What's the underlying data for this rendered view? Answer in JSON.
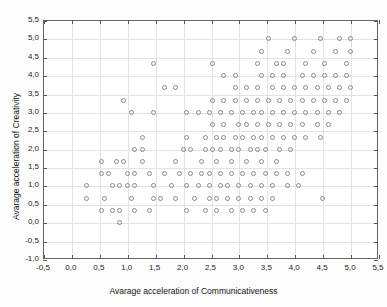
{
  "chart_data": {
    "type": "scatter",
    "title": "",
    "xlabel": "Avarage acceleration of Communicativeness",
    "ylabel": "Avarage acceleration of Creativity",
    "xlim": [
      -0.5,
      5.5
    ],
    "ylim": [
      -1.0,
      5.5
    ],
    "xticks": [
      -0.5,
      0.0,
      0.5,
      1.0,
      1.5,
      2.0,
      2.5,
      3.0,
      3.5,
      4.0,
      4.5,
      5.0,
      5.5
    ],
    "yticks": [
      -1.0,
      -0.5,
      0.0,
      0.5,
      1.0,
      1.5,
      2.0,
      2.5,
      3.0,
      3.5,
      4.0,
      4.5,
      5.0,
      5.5
    ],
    "xtick_labels": [
      "-0,5",
      "0,0",
      "0,5",
      "1,0",
      "1,5",
      "2,0",
      "2,5",
      "3,0",
      "3,5",
      "4,0",
      "4,5",
      "5,0",
      "5,5"
    ],
    "ytick_labels": [
      "-1,0",
      "-0,5",
      "0,0",
      "0,5",
      "1,0",
      "1,5",
      "2,0",
      "2,5",
      "3,0",
      "3,5",
      "4,0",
      "4,5",
      "5,0",
      "5,5"
    ],
    "grid": true,
    "legend": false,
    "marker": "open-circle",
    "marker_color": "#8a8a94",
    "points": [
      [
        0.87,
        0.0
      ],
      [
        0.53,
        0.33
      ],
      [
        0.73,
        0.33
      ],
      [
        0.87,
        0.33
      ],
      [
        1.13,
        0.33
      ],
      [
        1.4,
        0.33
      ],
      [
        2.07,
        0.33
      ],
      [
        2.4,
        0.33
      ],
      [
        2.6,
        0.33
      ],
      [
        2.87,
        0.33
      ],
      [
        3.07,
        0.33
      ],
      [
        3.27,
        0.33
      ],
      [
        3.47,
        0.33
      ],
      [
        0.27,
        0.67
      ],
      [
        0.6,
        0.67
      ],
      [
        1.07,
        0.67
      ],
      [
        1.47,
        0.67
      ],
      [
        1.6,
        0.67
      ],
      [
        1.87,
        0.67
      ],
      [
        2.2,
        0.67
      ],
      [
        2.47,
        0.67
      ],
      [
        2.6,
        0.67
      ],
      [
        2.8,
        0.67
      ],
      [
        3.0,
        0.67
      ],
      [
        3.2,
        0.67
      ],
      [
        3.4,
        0.67
      ],
      [
        3.6,
        0.67
      ],
      [
        4.5,
        0.65
      ],
      [
        0.27,
        1.0
      ],
      [
        0.73,
        1.0
      ],
      [
        0.87,
        1.0
      ],
      [
        1.0,
        1.0
      ],
      [
        1.13,
        1.0
      ],
      [
        1.47,
        1.0
      ],
      [
        1.8,
        1.0
      ],
      [
        2.07,
        1.0
      ],
      [
        2.27,
        1.0
      ],
      [
        2.47,
        1.0
      ],
      [
        2.67,
        1.0
      ],
      [
        2.8,
        1.0
      ],
      [
        3.0,
        1.0
      ],
      [
        3.2,
        1.0
      ],
      [
        3.4,
        1.0
      ],
      [
        3.6,
        1.0
      ],
      [
        3.87,
        1.0
      ],
      [
        4.07,
        1.0
      ],
      [
        0.53,
        1.33
      ],
      [
        0.67,
        1.33
      ],
      [
        1.0,
        1.33
      ],
      [
        1.13,
        1.33
      ],
      [
        1.4,
        1.33
      ],
      [
        1.67,
        1.33
      ],
      [
        1.93,
        1.33
      ],
      [
        2.13,
        1.33
      ],
      [
        2.33,
        1.33
      ],
      [
        2.47,
        1.33
      ],
      [
        2.67,
        1.33
      ],
      [
        2.87,
        1.33
      ],
      [
        3.07,
        1.33
      ],
      [
        3.27,
        1.33
      ],
      [
        3.47,
        1.33
      ],
      [
        3.67,
        1.33
      ],
      [
        3.87,
        1.33
      ],
      [
        4.13,
        1.33
      ],
      [
        0.53,
        1.67
      ],
      [
        0.8,
        1.67
      ],
      [
        0.93,
        1.67
      ],
      [
        1.27,
        1.67
      ],
      [
        1.87,
        1.67
      ],
      [
        2.33,
        1.67
      ],
      [
        2.6,
        1.67
      ],
      [
        2.87,
        1.67
      ],
      [
        3.13,
        1.67
      ],
      [
        3.4,
        1.67
      ],
      [
        3.67,
        1.67
      ],
      [
        1.13,
        2.0
      ],
      [
        1.27,
        2.0
      ],
      [
        2.0,
        2.0
      ],
      [
        2.13,
        2.0
      ],
      [
        2.4,
        2.0
      ],
      [
        2.53,
        2.0
      ],
      [
        2.67,
        2.0
      ],
      [
        2.87,
        2.0
      ],
      [
        3.0,
        2.0
      ],
      [
        3.2,
        2.0
      ],
      [
        3.33,
        2.0
      ],
      [
        3.47,
        2.0
      ],
      [
        3.73,
        2.0
      ],
      [
        3.93,
        2.0
      ],
      [
        1.27,
        2.33
      ],
      [
        2.07,
        2.33
      ],
      [
        2.4,
        2.33
      ],
      [
        2.6,
        2.33
      ],
      [
        2.73,
        2.33
      ],
      [
        2.93,
        2.33
      ],
      [
        3.07,
        2.33
      ],
      [
        3.27,
        2.33
      ],
      [
        3.4,
        2.33
      ],
      [
        3.6,
        2.33
      ],
      [
        3.8,
        2.33
      ],
      [
        4.0,
        2.33
      ],
      [
        4.2,
        2.33
      ],
      [
        4.47,
        2.33
      ],
      [
        2.53,
        2.67
      ],
      [
        2.73,
        2.67
      ],
      [
        3.0,
        2.67
      ],
      [
        3.13,
        2.67
      ],
      [
        3.33,
        2.67
      ],
      [
        3.53,
        2.67
      ],
      [
        3.73,
        2.67
      ],
      [
        3.93,
        2.67
      ],
      [
        4.13,
        2.67
      ],
      [
        4.4,
        2.67
      ],
      [
        4.6,
        2.67
      ],
      [
        1.07,
        3.0
      ],
      [
        1.47,
        3.0
      ],
      [
        2.07,
        3.0
      ],
      [
        2.27,
        3.0
      ],
      [
        2.47,
        3.0
      ],
      [
        2.67,
        3.0
      ],
      [
        2.87,
        3.0
      ],
      [
        3.07,
        3.0
      ],
      [
        3.27,
        3.0
      ],
      [
        3.4,
        3.0
      ],
      [
        3.6,
        3.0
      ],
      [
        3.8,
        3.0
      ],
      [
        4.0,
        3.0
      ],
      [
        4.2,
        3.0
      ],
      [
        4.4,
        3.0
      ],
      [
        4.6,
        3.0
      ],
      [
        4.8,
        3.0
      ],
      [
        0.93,
        3.33
      ],
      [
        2.53,
        3.33
      ],
      [
        2.73,
        3.33
      ],
      [
        2.93,
        3.33
      ],
      [
        3.13,
        3.33
      ],
      [
        3.33,
        3.33
      ],
      [
        3.53,
        3.33
      ],
      [
        3.73,
        3.33
      ],
      [
        3.93,
        3.33
      ],
      [
        4.13,
        3.33
      ],
      [
        4.33,
        3.33
      ],
      [
        4.53,
        3.33
      ],
      [
        4.73,
        3.33
      ],
      [
        4.93,
        3.33
      ],
      [
        1.67,
        3.67
      ],
      [
        1.87,
        3.67
      ],
      [
        2.93,
        3.67
      ],
      [
        3.13,
        3.67
      ],
      [
        3.33,
        3.67
      ],
      [
        3.6,
        3.67
      ],
      [
        3.8,
        3.67
      ],
      [
        4.0,
        3.67
      ],
      [
        4.2,
        3.67
      ],
      [
        4.4,
        3.67
      ],
      [
        4.6,
        3.67
      ],
      [
        4.8,
        3.67
      ],
      [
        5.0,
        3.67
      ],
      [
        2.73,
        4.0
      ],
      [
        2.93,
        4.0
      ],
      [
        3.4,
        4.0
      ],
      [
        3.6,
        4.0
      ],
      [
        3.8,
        4.0
      ],
      [
        4.13,
        4.0
      ],
      [
        4.33,
        4.0
      ],
      [
        4.53,
        4.0
      ],
      [
        4.73,
        4.0
      ],
      [
        4.93,
        4.0
      ],
      [
        1.47,
        4.33
      ],
      [
        2.53,
        4.33
      ],
      [
        3.33,
        4.33
      ],
      [
        3.67,
        4.33
      ],
      [
        3.8,
        4.33
      ],
      [
        4.2,
        4.33
      ],
      [
        4.53,
        4.33
      ],
      [
        4.93,
        4.33
      ],
      [
        3.4,
        4.67
      ],
      [
        3.87,
        4.67
      ],
      [
        4.33,
        4.67
      ],
      [
        4.73,
        4.67
      ],
      [
        5.0,
        4.67
      ],
      [
        3.53,
        5.0
      ],
      [
        4.0,
        5.0
      ],
      [
        4.47,
        5.0
      ],
      [
        4.8,
        5.0
      ],
      [
        5.0,
        5.0
      ]
    ]
  }
}
